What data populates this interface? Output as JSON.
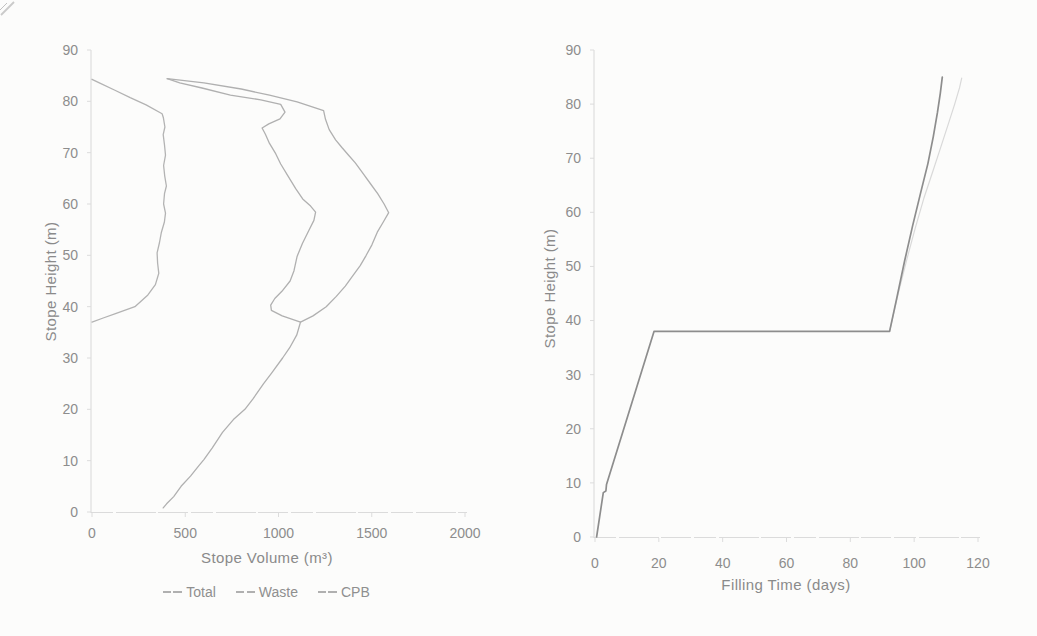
{
  "page": {
    "background": "#fcfcfb",
    "text_color": "#8a8a8a",
    "axis_line_color": "#d8d8d8",
    "tick_color": "#dcdcdc"
  },
  "chart_data": [
    {
      "id": "stope-volume-chart",
      "type": "line",
      "title": "",
      "xlabel": "Stope Volume (m³)",
      "ylabel": "Stope Height (m)",
      "xlim": [
        0,
        2000
      ],
      "ylim": [
        0,
        90
      ],
      "xticks": [
        0,
        500,
        1000,
        1500,
        2000
      ],
      "yticks": [
        0,
        10,
        20,
        30,
        40,
        50,
        60,
        70,
        80,
        90
      ],
      "grid": false,
      "legend_position": "bottom",
      "series": [
        {
          "name": "Total",
          "color": "#b0b0b0",
          "width": 1.3,
          "points": [
            [
              382,
              0.8
            ],
            [
              400,
              1.6
            ],
            [
              438,
              3
            ],
            [
              478,
              5
            ],
            [
              528,
              7
            ],
            [
              572,
              9
            ],
            [
              600,
              10.2
            ],
            [
              645,
              12.5
            ],
            [
              700,
              15.5
            ],
            [
              758,
              18
            ],
            [
              820,
              20
            ],
            [
              862,
              22
            ],
            [
              920,
              25
            ],
            [
              962,
              27
            ],
            [
              1022,
              30
            ],
            [
              1060,
              32
            ],
            [
              1098,
              34.5
            ],
            [
              1110,
              36
            ],
            [
              1118,
              37
            ],
            [
              1185,
              38.2
            ],
            [
              1256,
              40
            ],
            [
              1310,
              42
            ],
            [
              1358,
              44
            ],
            [
              1398,
              46
            ],
            [
              1438,
              48
            ],
            [
              1470,
              50
            ],
            [
              1500,
              52
            ],
            [
              1530,
              54.5
            ],
            [
              1562,
              56.5
            ],
            [
              1591,
              58.3
            ],
            [
              1566,
              60
            ],
            [
              1532,
              62
            ],
            [
              1492,
              64
            ],
            [
              1452,
              66
            ],
            [
              1412,
              68
            ],
            [
              1376,
              69.5
            ],
            [
              1340,
              71
            ],
            [
              1306,
              72.5
            ],
            [
              1272,
              74.5
            ],
            [
              1252,
              76.5
            ],
            [
              1242,
              78.2
            ],
            [
              1100,
              79.9
            ],
            [
              952,
              81.2
            ],
            [
              800,
              82.4
            ],
            [
              600,
              83.6
            ],
            [
              403,
              84.4
            ]
          ]
        },
        {
          "name": "Waste",
          "color": "#b0b0b0",
          "width": 1.3,
          "points": [
            [
              1118,
              37
            ],
            [
              1020,
              38.2
            ],
            [
              962,
              39.3
            ],
            [
              958,
              40.3
            ],
            [
              980,
              41.6
            ],
            [
              1018,
              43
            ],
            [
              1062,
              45
            ],
            [
              1083,
              47
            ],
            [
              1100,
              49.8
            ],
            [
              1128,
              52.3
            ],
            [
              1162,
              54.8
            ],
            [
              1190,
              56.8
            ],
            [
              1199,
              58.4
            ],
            [
              1172,
              59.6
            ],
            [
              1130,
              61
            ],
            [
              1092,
              63
            ],
            [
              1052,
              65.4
            ],
            [
              1012,
              67.8
            ],
            [
              985,
              69.8
            ],
            [
              952,
              71.8
            ],
            [
              930,
              73.6
            ],
            [
              912,
              74.8
            ],
            [
              948,
              75.6
            ],
            [
              1008,
              76.6
            ],
            [
              1035,
              77.9
            ],
            [
              1012,
              79.4
            ],
            [
              905,
              80.3
            ],
            [
              742,
              81.2
            ],
            [
              590,
              82.6
            ],
            [
              470,
              83.6
            ],
            [
              403,
              84.4
            ]
          ]
        },
        {
          "name": "CPB",
          "color": "#b3b3b3",
          "width": 1.3,
          "points": [
            [
              0,
              37
            ],
            [
              60,
              37.8
            ],
            [
              130,
              38.7
            ],
            [
              230,
              40
            ],
            [
              300,
              42.3
            ],
            [
              340,
              44.3
            ],
            [
              358,
              46.5
            ],
            [
              352,
              48.5
            ],
            [
              349,
              50.5
            ],
            [
              362,
              52.5
            ],
            [
              372,
              54.5
            ],
            [
              388,
              56.5
            ],
            [
              394,
              58.2
            ],
            [
              384,
              60
            ],
            [
              389,
              62
            ],
            [
              399,
              63.5
            ],
            [
              390,
              65.5
            ],
            [
              384,
              67.5
            ],
            [
              394,
              69.5
            ],
            [
              389,
              71.5
            ],
            [
              382,
              73.5
            ],
            [
              391,
              75
            ],
            [
              383,
              76.8
            ],
            [
              376,
              77.6
            ],
            [
              290,
              79.3
            ],
            [
              205,
              80.7
            ],
            [
              120,
              82.2
            ],
            [
              45,
              83.5
            ],
            [
              0,
              84.3
            ]
          ]
        }
      ]
    },
    {
      "id": "filling-time-chart",
      "type": "line",
      "title": "",
      "xlabel": "Filling Time (days)",
      "ylabel": "Stope Height (m)",
      "xlim": [
        0,
        120
      ],
      "ylim": [
        0,
        90
      ],
      "xticks": [
        0,
        20,
        40,
        60,
        80,
        100,
        120
      ],
      "yticks": [
        0,
        10,
        20,
        30,
        40,
        50,
        60,
        70,
        80,
        90
      ],
      "grid": false,
      "legend_position": "none",
      "series": [
        {
          "name": "filling-curve-secondary",
          "color": "#d9d9d9",
          "width": 1.2,
          "points": [
            [
              92.3,
              38
            ],
            [
              95,
              45
            ],
            [
              97.8,
              51.5
            ],
            [
              100.3,
              57
            ],
            [
              103,
              62.5
            ],
            [
              105.8,
              67.5
            ],
            [
              108.3,
              72
            ],
            [
              110.8,
              76.5
            ],
            [
              112.7,
              80
            ],
            [
              114.2,
              83
            ],
            [
              114.9,
              84.8
            ]
          ]
        },
        {
          "name": "filling-curve",
          "color": "#8d8d8d",
          "width": 1.7,
          "points": [
            [
              0.5,
              0
            ],
            [
              2.6,
              8.2
            ],
            [
              3.4,
              8.5
            ],
            [
              3.6,
              9.7
            ],
            [
              18.5,
              38
            ],
            [
              92.3,
              38
            ],
            [
              94.5,
              44
            ],
            [
              97,
              51
            ],
            [
              99.5,
              57.5
            ],
            [
              102,
              63.5
            ],
            [
              104.3,
              69
            ],
            [
              106,
              74
            ],
            [
              107.3,
              78.5
            ],
            [
              108.2,
              82
            ],
            [
              108.8,
              85
            ]
          ]
        }
      ]
    }
  ]
}
